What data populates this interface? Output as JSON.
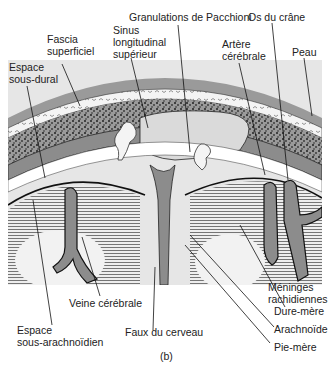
{
  "figure": {
    "caption": "(b)",
    "colors": {
      "skin": "#9a9a9a",
      "dark_layer": "#8c8c8c",
      "light_layer": "#dadada",
      "white": "#ffffff",
      "line": "#1a1a1a",
      "brain_bg": "#e6e6e6"
    }
  },
  "labels": {
    "granulations": "Granulations de Pacchioni",
    "os_du_crane": "Os du crâne",
    "fascia_1": "Fascia",
    "fascia_2": "superficiel",
    "sinus_1": "Sinus",
    "sinus_2": "longitudinal",
    "sinus_3": "supérieur",
    "artere_1": "Artère",
    "artere_2": "cérébrale",
    "peau": "Peau",
    "espace_sd_1": "Espace",
    "espace_sd_2": "sous-dural",
    "veine": "Veine cérébrale",
    "espace_sa_1": "Espace",
    "espace_sa_2": "sous-arachnoïdien",
    "faux": "Faux du cerveau",
    "meninges_1": "Méninges",
    "meninges_2": "rachidiennes",
    "dure_mere": "Dure-mère",
    "arachnoide": "Arachnoïde",
    "pie_mere": "Pie-mère"
  }
}
